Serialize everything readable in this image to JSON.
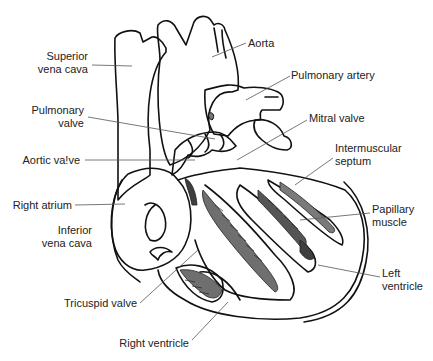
{
  "diagram": {
    "colors": {
      "outline": "#111111",
      "shade": "#6f6f6f",
      "shade_dark": "#3f3f3f",
      "leader": "#555555",
      "text": "#222222"
    },
    "labels": [
      {
        "id": "superior-vena-cava",
        "lines": [
          "Superior",
          "vena cava"
        ],
        "align": "r",
        "x": 10,
        "y": 50,
        "w": 78,
        "leader": [
          [
            92,
            65
          ],
          [
            132,
            66
          ]
        ]
      },
      {
        "id": "pulmonary-valve",
        "lines": [
          "Pulmonary",
          "valve"
        ],
        "align": "r",
        "x": 10,
        "y": 104,
        "w": 74,
        "leader": [
          [
            88,
            117
          ],
          [
            215,
            139
          ]
        ]
      },
      {
        "id": "aortic-valve",
        "lines": [
          "Aortic va!ve"
        ],
        "align": "r",
        "x": 10,
        "y": 154,
        "w": 70,
        "leader": [
          [
            85,
            160
          ],
          [
            195,
            160
          ]
        ]
      },
      {
        "id": "right-atrium",
        "lines": [
          "Right atrium"
        ],
        "align": "r",
        "x": 5,
        "y": 199,
        "w": 67,
        "leader": [
          [
            75,
            205
          ],
          [
            125,
            204
          ]
        ]
      },
      {
        "id": "inferior-vena-cava",
        "lines": [
          "Inferior",
          "vena cava"
        ],
        "align": "r",
        "x": 10,
        "y": 224,
        "w": 82,
        "leader": null
      },
      {
        "id": "tricuspid-valve",
        "lines": [
          "Tricuspid valve"
        ],
        "align": "r",
        "x": 40,
        "y": 297,
        "w": 97,
        "leader": [
          [
            140,
            303
          ],
          [
            198,
            250
          ]
        ]
      },
      {
        "id": "right-ventricle",
        "lines": [
          "Right ventricle"
        ],
        "align": "r",
        "x": 110,
        "y": 337,
        "w": 79,
        "leader": [
          [
            192,
            340
          ],
          [
            228,
            302
          ]
        ]
      },
      {
        "id": "aorta",
        "lines": [
          "Aorta"
        ],
        "align": "l",
        "x": 248,
        "y": 37,
        "w": 40,
        "leader": [
          [
            246,
            43
          ],
          [
            212,
            57
          ]
        ]
      },
      {
        "id": "pulmonary-artery",
        "lines": [
          "Pulmonary artery"
        ],
        "align": "l",
        "x": 291,
        "y": 69,
        "w": 100,
        "leader": [
          [
            290,
            76
          ],
          [
            246,
            100
          ]
        ]
      },
      {
        "id": "mitral-valve",
        "lines": [
          "Mitral valve"
        ],
        "align": "l",
        "x": 309,
        "y": 112,
        "w": 70,
        "leader": [
          [
            307,
            120
          ],
          [
            237,
            160
          ]
        ]
      },
      {
        "id": "intermuscular-septum",
        "lines": [
          "Intermuscular",
          "septum"
        ],
        "align": "l",
        "x": 335,
        "y": 142,
        "w": 92,
        "leader": [
          [
            333,
            158
          ],
          [
            295,
            185
          ]
        ]
      },
      {
        "id": "papillary-muscle",
        "lines": [
          "Papillary",
          "muscle"
        ],
        "align": "l",
        "x": 372,
        "y": 203,
        "w": 60,
        "leader": [
          [
            370,
            213
          ],
          [
            300,
            220
          ]
        ]
      },
      {
        "id": "left-ventricle",
        "lines": [
          "Left",
          "ventricle"
        ],
        "align": "l",
        "x": 382,
        "y": 267,
        "w": 50,
        "leader": [
          [
            380,
            277
          ],
          [
            318,
            265
          ]
        ]
      }
    ]
  }
}
